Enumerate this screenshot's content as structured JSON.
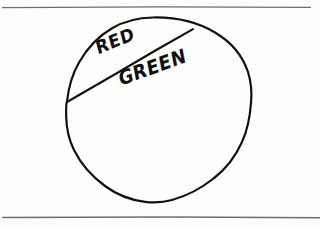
{
  "page": {
    "background_color": "#fdfdfc",
    "width": 320,
    "height": 227
  },
  "rules": {
    "ink_color": "#6e6e6e",
    "top_rule": {
      "name": "top-horizontal-rule",
      "y": 7,
      "x_start": 2,
      "x_end": 311
    },
    "bottom_rule": {
      "name": "bottom-horizontal-rule",
      "y": 217,
      "x_start": 2,
      "x_end": 320
    }
  },
  "diagram": {
    "name": "circle-divided-by-chord",
    "ink_color": "#111111",
    "circle": {
      "label": "circle-outline",
      "center_x": 158,
      "center_y": 110,
      "radius": 92
    },
    "chord": {
      "label": "chord-divider",
      "x1": 67,
      "y1": 102,
      "x2": 193,
      "y2": 29
    },
    "regions": [
      {
        "name": "red-segment",
        "label": "RED",
        "position": "upper-left minor segment",
        "label_x": 94,
        "label_y": 40,
        "rotation_deg": -22
      },
      {
        "name": "green-segment",
        "label": "GREEN",
        "position": "lower major segment",
        "label_x": 117,
        "label_y": 70,
        "rotation_deg": -20
      }
    ]
  }
}
